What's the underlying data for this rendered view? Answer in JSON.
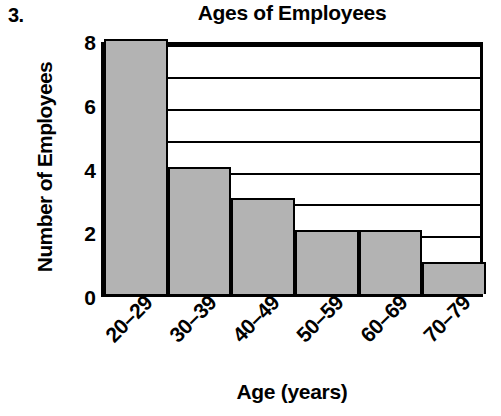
{
  "problem": {
    "number": "3."
  },
  "chart_data": {
    "type": "bar",
    "title": "Ages of Employees",
    "xlabel": "Age (years)",
    "ylabel": "Number of Employees",
    "categories": [
      "20–29",
      "30–39",
      "40–49",
      "50–59",
      "60–69",
      "70–79"
    ],
    "values": [
      8,
      4,
      3,
      2,
      2,
      1
    ],
    "ylim": [
      0,
      8
    ],
    "ytick_labels": [
      "0",
      "2",
      "4",
      "6",
      "8"
    ],
    "ytick_values": [
      0,
      2,
      4,
      6,
      8
    ],
    "gridlines": [
      1,
      2,
      3,
      4,
      5,
      6,
      7,
      8
    ],
    "grid": true,
    "legend": "none",
    "bar_fill_color": "#b3b3b3",
    "bar_edge_color": "#000000",
    "background_color": "#ffffff",
    "xtick_rotation_degrees": -45
  }
}
